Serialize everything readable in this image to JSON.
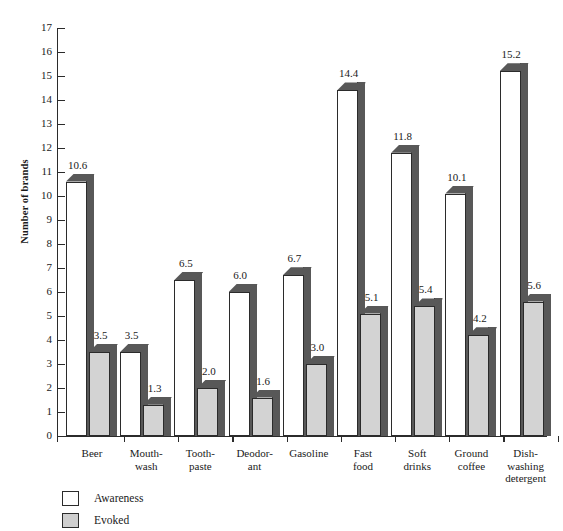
{
  "chart_data": {
    "type": "bar",
    "title": "",
    "xlabel": "",
    "ylabel": "Number of brands",
    "ylim": [
      0,
      17
    ],
    "y_ticks": [
      0,
      1,
      2,
      3,
      4,
      5,
      6,
      7,
      8,
      9,
      10,
      11,
      12,
      13,
      14,
      15,
      16,
      17
    ],
    "grid": false,
    "legend_position": "bottom-left",
    "categories": [
      "Beer",
      "Mouth-\nwash",
      "Tooth-\npaste",
      "Deodor-\nant",
      "Gasoline",
      "Fast\nfood",
      "Soft\ndrinks",
      "Ground\ncoffee",
      "Dish-\nwashing\ndetergent"
    ],
    "category_lines": [
      [
        "Beer"
      ],
      [
        "Mouth-",
        "wash"
      ],
      [
        "Tooth-",
        "paste"
      ],
      [
        "Deodor-",
        "ant"
      ],
      [
        "Gasoline"
      ],
      [
        "Fast",
        "food"
      ],
      [
        "Soft",
        "drinks"
      ],
      [
        "Ground",
        "coffee"
      ],
      [
        "Dish-",
        "washing",
        "detergent"
      ]
    ],
    "series": [
      {
        "name": "Awareness",
        "color": "#ffffff",
        "values": [
          10.6,
          3.5,
          6.5,
          6.0,
          6.7,
          14.4,
          11.8,
          10.1,
          15.2
        ],
        "labels": [
          "10.6",
          "3.5",
          "6.5",
          "6.0",
          "6.7",
          "14.4",
          "11.8",
          "10.1",
          "15.2"
        ]
      },
      {
        "name": "Evoked",
        "color": "#d3d3d3",
        "values": [
          3.5,
          1.3,
          2.0,
          1.6,
          3.0,
          5.1,
          5.4,
          4.2,
          5.6
        ],
        "labels": [
          "3.5",
          "1.3",
          "2.0",
          "1.6",
          "3.0",
          "5.1",
          "5.4",
          "4.2",
          "5.6"
        ]
      }
    ]
  },
  "legend": {
    "items": [
      {
        "label": "Awareness",
        "swatch": "white-square-icon"
      },
      {
        "label": "Evoked",
        "swatch": "gray-square-icon"
      }
    ]
  },
  "colors": {
    "bar_awareness_fill": "#ffffff",
    "bar_evoked_fill": "#d3d3d3",
    "bar_shadow": "#585858",
    "outline": "#2b2b2b",
    "background": "#ffffff",
    "text": "#1a1a1a"
  },
  "corner_artifact": ""
}
